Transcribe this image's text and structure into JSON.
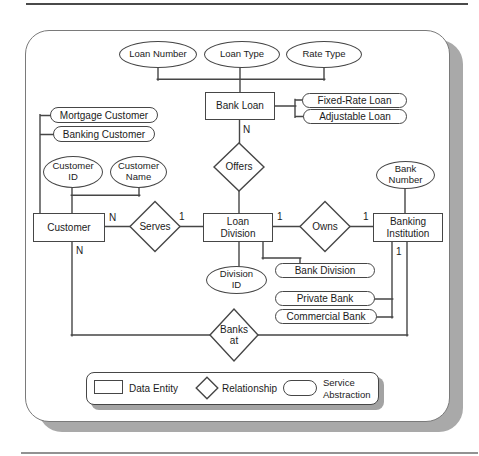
{
  "entities": {
    "bank_loan": "Bank Loan",
    "customer": "Customer",
    "loan_division": "Loan\nDivision",
    "banking_institution": "Banking\nInstitution"
  },
  "relationships": {
    "offers": "Offers",
    "serves": "Serves",
    "owns": "Owns",
    "banks_at": "Banks\nat"
  },
  "attributes": {
    "loan_number": "Loan Number",
    "loan_type": "Loan Type",
    "rate_type": "Rate Type",
    "customer_id": "Customer\nID",
    "customer_name": "Customer\nName",
    "bank_number": "Bank\nNumber",
    "division_id": "Division\nID"
  },
  "abstractions": {
    "fixed_rate_loan": "Fixed-Rate Loan",
    "adjustable_loan": "Adjustable Loan",
    "mortgage_customer": "Mortgage Customer",
    "banking_customer": "Banking Customer",
    "bank_division": "Bank Division",
    "private_bank": "Private Bank",
    "commercial_bank": "Commercial Bank"
  },
  "cardinalities": {
    "bank_loan_offers": "N",
    "customer_serves": "N",
    "serves_loan_division": "1",
    "loan_division_owns": "1",
    "owns_banking_institution": "1",
    "customer_banks_at": "N",
    "banking_institution_banks_at": "1"
  },
  "legend": {
    "data_entity": "Data Entity",
    "relationship": "Relationship",
    "service_abstraction": "Service\nAbstraction"
  },
  "colors": {
    "line": "#464646",
    "text": "#1b1b1b",
    "panel_shadow": "#a9a9a9",
    "background": "#ffffff"
  }
}
